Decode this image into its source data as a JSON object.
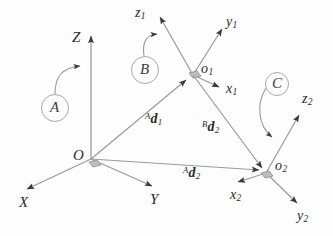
{
  "figure": {
    "background_color": "#fdfdfd",
    "line_color": "#8c8c8c",
    "arrow_color": "#3a3a3a",
    "text_color": "#2b2b2b",
    "frame_marker_color": "#b9b9b9"
  },
  "world_frame": {
    "origin_label": "O",
    "axes": [
      {
        "name": "x-axis",
        "label": "X"
      },
      {
        "name": "y-axis",
        "label": "Y"
      },
      {
        "name": "z-axis",
        "label": "Z"
      }
    ]
  },
  "frame_1": {
    "origin_label": "o",
    "origin_sub": "1",
    "axes": [
      {
        "name": "x1-axis",
        "label": "x",
        "sub": "1"
      },
      {
        "name": "y1-axis",
        "label": "y",
        "sub": "1"
      },
      {
        "name": "z1-axis",
        "label": "z",
        "sub": "1"
      }
    ]
  },
  "frame_2": {
    "origin_label": "o",
    "origin_sub": "2",
    "axes": [
      {
        "name": "x2-axis",
        "label": "x",
        "sub": "2"
      },
      {
        "name": "y2-axis",
        "label": "y",
        "sub": "2"
      },
      {
        "name": "z2-axis",
        "label": "z",
        "sub": "2"
      }
    ]
  },
  "frame_callouts": [
    {
      "name": "callout-a",
      "label": "A",
      "points_to": "Z axis of world frame O"
    },
    {
      "name": "callout-b",
      "label": "B",
      "points_to": "z1 axis of frame o1"
    },
    {
      "name": "callout-c",
      "label": "C",
      "points_to": "z2 axis of frame o2"
    }
  ],
  "vectors": [
    {
      "name": "vector-a-d1",
      "prefix": "A",
      "symbol": "d",
      "sub": "1",
      "from": "O",
      "to": "o1"
    },
    {
      "name": "vector-b-d2",
      "prefix": "B",
      "symbol": "d",
      "sub": "2",
      "from": "o1",
      "to": "o2"
    },
    {
      "name": "vector-a-d2",
      "prefix": "A",
      "symbol": "d",
      "sub": "2",
      "from": "O",
      "to": "o2"
    }
  ]
}
